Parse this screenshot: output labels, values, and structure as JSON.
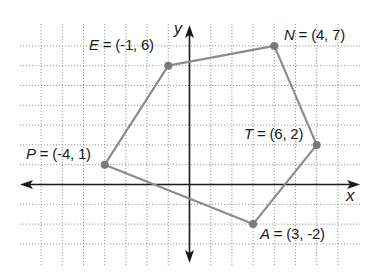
{
  "diagram": {
    "type": "coordinate-plane-polygon",
    "axes": {
      "x_label": "x",
      "y_label": "y",
      "x_range": [
        -8,
        7
      ],
      "y_range": [
        -4,
        8
      ]
    },
    "grid": {
      "style": "dotted",
      "color": "#9a9a9a"
    },
    "polygon": {
      "stroke": "#8c8c8c",
      "vertex_color": "#7a7a7a",
      "order": [
        "E",
        "N",
        "T",
        "A",
        "P"
      ]
    },
    "points": [
      {
        "name": "E",
        "x": -1,
        "y": 6,
        "label": "E = (-1, 6)"
      },
      {
        "name": "N",
        "x": 4,
        "y": 7,
        "label": "N = (4, 7)"
      },
      {
        "name": "T",
        "x": 6,
        "y": 2,
        "label": "T = (6, 2)"
      },
      {
        "name": "A",
        "x": 3,
        "y": -2,
        "label": "A = (3, -2)"
      },
      {
        "name": "P",
        "x": -4,
        "y": 1,
        "label": "P = (-4, 1)"
      }
    ]
  },
  "labels": {
    "E": {
      "name": "E",
      "eq": " = (-1, 6)"
    },
    "N": {
      "name": "N",
      "eq": " = (4, 7)"
    },
    "T": {
      "name": "T",
      "eq": " = (6, 2)"
    },
    "A": {
      "name": "A",
      "eq": " = (3, -2)"
    },
    "P": {
      "name": "P",
      "eq": " = (-4, 1)"
    },
    "x_axis": "x",
    "y_axis": "y"
  }
}
